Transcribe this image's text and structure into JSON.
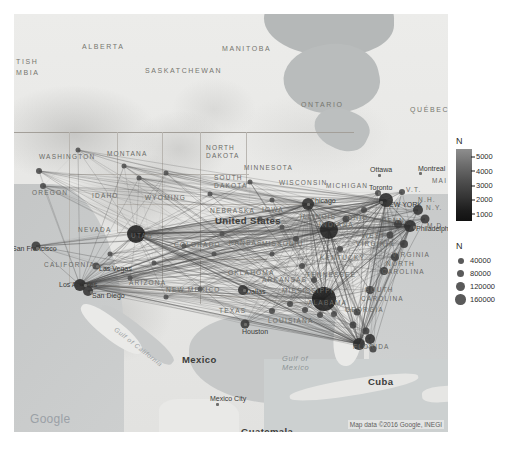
{
  "map": {
    "provider": "Google Maps",
    "google_logo": "Google",
    "attribution": "Map data ©2016 Google, INEGI",
    "countries": [
      {
        "name": "United States",
        "x": 201,
        "y": 201
      },
      {
        "name": "Mexico",
        "x": 168,
        "y": 340
      },
      {
        "name": "Cuba",
        "x": 354,
        "y": 362
      },
      {
        "name": "Guatemala",
        "x": 227,
        "y": 412
      },
      {
        "name": "Honduras",
        "x": 262,
        "y": 419
      },
      {
        "name": "Dominic",
        "x": 441,
        "y": 375
      },
      {
        "name": "Republ",
        "x": 442,
        "y": 383
      }
    ],
    "provinces": [
      {
        "name": "TISH",
        "x": 2,
        "y": 44
      },
      {
        "name": "MBIA",
        "x": 2,
        "y": 55
      },
      {
        "name": "ALBERTA",
        "x": 68,
        "y": 29
      },
      {
        "name": "SASKATCHEWAN",
        "x": 131,
        "y": 53
      },
      {
        "name": "MANITOBA",
        "x": 208,
        "y": 31
      },
      {
        "name": "ONTARIO",
        "x": 287,
        "y": 87
      },
      {
        "name": "QUÉBEC",
        "x": 396,
        "y": 92
      }
    ],
    "states": [
      {
        "name": "WASHINGTON",
        "x": 25,
        "y": 139
      },
      {
        "name": "MONTANA",
        "x": 93,
        "y": 136
      },
      {
        "name": "NORTH",
        "x": 192,
        "y": 130
      },
      {
        "name": "DAKOTA",
        "x": 192,
        "y": 138
      },
      {
        "name": "MINNESOTA",
        "x": 230,
        "y": 150
      },
      {
        "name": "OREGON",
        "x": 18,
        "y": 175
      },
      {
        "name": "IDAHO",
        "x": 78,
        "y": 178
      },
      {
        "name": "WYOMING",
        "x": 131,
        "y": 180
      },
      {
        "name": "SOUTH",
        "x": 200,
        "y": 160
      },
      {
        "name": "DAKOTA",
        "x": 200,
        "y": 168
      },
      {
        "name": "WISCONSIN",
        "x": 265,
        "y": 165
      },
      {
        "name": "MICHIGAN",
        "x": 312,
        "y": 168
      },
      {
        "name": "NEBRASKA",
        "x": 196,
        "y": 193
      },
      {
        "name": "IOWA",
        "x": 248,
        "y": 192
      },
      {
        "name": "ILLINOIS",
        "x": 286,
        "y": 199
      },
      {
        "name": "NEVADA",
        "x": 64,
        "y": 212
      },
      {
        "name": "UTAH",
        "x": 117,
        "y": 218
      },
      {
        "name": "COLORADO",
        "x": 160,
        "y": 227
      },
      {
        "name": "KANSAS",
        "x": 215,
        "y": 225
      },
      {
        "name": "MISSOURI",
        "x": 248,
        "y": 226
      },
      {
        "name": "INDIANA",
        "x": 305,
        "y": 207
      },
      {
        "name": "OHIO",
        "x": 333,
        "y": 200
      },
      {
        "name": "PENN.",
        "x": 368,
        "y": 203
      },
      {
        "name": "CALIFORNIA",
        "x": 30,
        "y": 247
      },
      {
        "name": "WEST",
        "x": 348,
        "y": 218
      },
      {
        "name": "VIRGINIA",
        "x": 342,
        "y": 226
      },
      {
        "name": "VIRGINIA",
        "x": 378,
        "y": 237
      },
      {
        "name": "KENTUCKY",
        "x": 306,
        "y": 240
      },
      {
        "name": "ARIZONA",
        "x": 115,
        "y": 265
      },
      {
        "name": "NEW MEXICO",
        "x": 152,
        "y": 272
      },
      {
        "name": "OKLAHOMA",
        "x": 214,
        "y": 255
      },
      {
        "name": "ARKANSAS",
        "x": 248,
        "y": 262
      },
      {
        "name": "TENNESSEE",
        "x": 292,
        "y": 257
      },
      {
        "name": "NORTH",
        "x": 372,
        "y": 246
      },
      {
        "name": "CAROLINA",
        "x": 368,
        "y": 254
      },
      {
        "name": "MISSISSIPPI",
        "x": 268,
        "y": 273
      },
      {
        "name": "SOUTH",
        "x": 351,
        "y": 272
      },
      {
        "name": "CAROLINA",
        "x": 347,
        "y": 281
      },
      {
        "name": "ALABAMA",
        "x": 294,
        "y": 285
      },
      {
        "name": "GEORGIA",
        "x": 331,
        "y": 292
      },
      {
        "name": "TEXAS",
        "x": 205,
        "y": 293
      },
      {
        "name": "LOUISIANA",
        "x": 254,
        "y": 303
      },
      {
        "name": "FLORIDA",
        "x": 339,
        "y": 329
      },
      {
        "name": "V.T.",
        "x": 392,
        "y": 172
      },
      {
        "name": "N.H.",
        "x": 404,
        "y": 182
      },
      {
        "name": "MAI",
        "x": 418,
        "y": 163
      },
      {
        "name": "N.Y.",
        "x": 412,
        "y": 190
      },
      {
        "name": "M.D.",
        "x": 413,
        "y": 208
      }
    ],
    "cities": [
      {
        "name": "Chicago",
        "x": 296,
        "y": 183,
        "dx": 293,
        "dy": 189
      },
      {
        "name": "Ottawa",
        "x": 356,
        "y": 152,
        "dx": 364,
        "dy": 160
      },
      {
        "name": "Montreal",
        "x": 404,
        "y": 151,
        "dx": 405,
        "dy": 158
      },
      {
        "name": "Toronto",
        "x": 355,
        "y": 170,
        "dx": 364,
        "dy": 178
      },
      {
        "name": "NEW YORK",
        "x": 370,
        "y": 187,
        "dx": 366,
        "dy": 187
      },
      {
        "name": "Philadelphia",
        "x": 402,
        "y": 211,
        "dx": 399,
        "dy": 212
      },
      {
        "name": "San Francisco",
        "x": -2,
        "y": 231,
        "dx": 22,
        "dy": 233
      },
      {
        "name": "Las Vegas",
        "x": 85,
        "y": 251,
        "dx": 82,
        "dy": 251
      },
      {
        "name": "Los Angeles",
        "x": 45,
        "y": 267,
        "dx": 70,
        "dy": 270
      },
      {
        "name": "San Diego",
        "x": 78,
        "y": 278,
        "dx": 76,
        "dy": 277
      },
      {
        "name": "Dallas",
        "x": 232,
        "y": 274,
        "dx": 229,
        "dy": 275
      },
      {
        "name": "Houston",
        "x": 228,
        "y": 314,
        "dx": 230,
        "dy": 309
      },
      {
        "name": "Mexico City",
        "x": 196,
        "y": 381,
        "dx": 202,
        "dy": 389
      }
    ],
    "seas": [
      {
        "name": "Gulf of",
        "x": 268,
        "y": 340
      },
      {
        "name": "Mexico",
        "x": 268,
        "y": 349
      },
      {
        "name": "Gulf of California",
        "x": 104,
        "y": 311
      }
    ]
  },
  "legends": {
    "color_legend": {
      "title": "N",
      "ticks": [
        5000,
        4000,
        3000,
        2000,
        1000
      ],
      "high_color": "#8e8e8e",
      "low_color": "#111111"
    },
    "size_legend": {
      "title": "N",
      "items": [
        {
          "label": "40000",
          "size": 6
        },
        {
          "label": "80000",
          "size": 7.5
        },
        {
          "label": "120000",
          "size": 9
        },
        {
          "label": "160000",
          "size": 10.5
        }
      ],
      "dot_color": "#5a5a5a"
    }
  },
  "network": {
    "edge_color": "#4a4a4a",
    "node_color": "#3c3c3c",
    "nodes": [
      {
        "x": 310,
        "y": 285,
        "r": 12,
        "c": "#1c1c1c"
      },
      {
        "x": 315,
        "y": 216,
        "r": 9,
        "c": "#252525"
      },
      {
        "x": 122,
        "y": 220,
        "r": 9,
        "c": "#202020"
      },
      {
        "x": 372,
        "y": 186,
        "r": 7,
        "c": "#2a2a2a"
      },
      {
        "x": 396,
        "y": 212,
        "r": 6,
        "c": "#2e2e2e"
      },
      {
        "x": 294,
        "y": 190,
        "r": 6,
        "c": "#303030"
      },
      {
        "x": 345,
        "y": 330,
        "r": 6,
        "c": "#2c2c2c"
      },
      {
        "x": 356,
        "y": 325,
        "r": 5,
        "c": "#303030"
      },
      {
        "x": 66,
        "y": 271,
        "r": 6,
        "c": "#2a2a2a"
      },
      {
        "x": 74,
        "y": 277,
        "r": 5,
        "c": "#333"
      },
      {
        "x": 22,
        "y": 232,
        "r": 4.5,
        "c": "#3a3a3a"
      },
      {
        "x": 229,
        "y": 276,
        "r": 5,
        "c": "#333"
      },
      {
        "x": 231,
        "y": 310,
        "r": 4.5,
        "c": "#383838"
      },
      {
        "x": 404,
        "y": 196,
        "r": 5,
        "c": "#333"
      },
      {
        "x": 411,
        "y": 205,
        "r": 4.5,
        "c": "#383838"
      },
      {
        "x": 390,
        "y": 230,
        "r": 4,
        "c": "#3c3c3c"
      },
      {
        "x": 381,
        "y": 243,
        "r": 4,
        "c": "#3c3c3c"
      },
      {
        "x": 370,
        "y": 257,
        "r": 4,
        "c": "#3c3c3c"
      },
      {
        "x": 356,
        "y": 276,
        "r": 4,
        "c": "#3c3c3c"
      },
      {
        "x": 343,
        "y": 298,
        "r": 3.5,
        "c": "#404040"
      },
      {
        "x": 339,
        "y": 311,
        "r": 3.5,
        "c": "#404040"
      },
      {
        "x": 352,
        "y": 317,
        "r": 3.5,
        "c": "#404040"
      },
      {
        "x": 359,
        "y": 335,
        "r": 3.5,
        "c": "#404040"
      },
      {
        "x": 82,
        "y": 252,
        "r": 3.5,
        "c": "#444"
      },
      {
        "x": 25,
        "y": 157,
        "r": 3,
        "c": "#4a4a4a"
      },
      {
        "x": 29,
        "y": 172,
        "r": 3,
        "c": "#4a4a4a"
      },
      {
        "x": 64,
        "y": 136,
        "r": 2.5,
        "c": "#505050"
      },
      {
        "x": 110,
        "y": 152,
        "r": 2.5,
        "c": "#505050"
      },
      {
        "x": 125,
        "y": 164,
        "r": 2.5,
        "c": "#505050"
      },
      {
        "x": 152,
        "y": 159,
        "r": 2.5,
        "c": "#505050"
      },
      {
        "x": 196,
        "y": 180,
        "r": 2.5,
        "c": "#505050"
      },
      {
        "x": 236,
        "y": 168,
        "r": 2.5,
        "c": "#505050"
      },
      {
        "x": 246,
        "y": 205,
        "r": 2.5,
        "c": "#505050"
      },
      {
        "x": 258,
        "y": 186,
        "r": 2.5,
        "c": "#505050"
      },
      {
        "x": 268,
        "y": 213,
        "r": 2.5,
        "c": "#505050"
      },
      {
        "x": 208,
        "y": 220,
        "r": 2.5,
        "c": "#505050"
      },
      {
        "x": 170,
        "y": 232,
        "r": 2.5,
        "c": "#505050"
      },
      {
        "x": 140,
        "y": 249,
        "r": 2.5,
        "c": "#505050"
      },
      {
        "x": 152,
        "y": 283,
        "r": 2.5,
        "c": "#505050"
      },
      {
        "x": 186,
        "y": 275,
        "r": 2.5,
        "c": "#505050"
      },
      {
        "x": 200,
        "y": 240,
        "r": 2.5,
        "c": "#505050"
      },
      {
        "x": 258,
        "y": 240,
        "r": 2.5,
        "c": "#4c4c4c"
      },
      {
        "x": 288,
        "y": 252,
        "r": 3,
        "c": "#484848"
      },
      {
        "x": 276,
        "y": 290,
        "r": 3,
        "c": "#484848"
      },
      {
        "x": 258,
        "y": 297,
        "r": 3,
        "c": "#484848"
      },
      {
        "x": 291,
        "y": 296,
        "r": 3,
        "c": "#484848"
      },
      {
        "x": 306,
        "y": 301,
        "r": 3,
        "c": "#484848"
      },
      {
        "x": 320,
        "y": 300,
        "r": 3,
        "c": "#484848"
      },
      {
        "x": 332,
        "y": 205,
        "r": 3.5,
        "c": "#444"
      },
      {
        "x": 350,
        "y": 196,
        "r": 3,
        "c": "#484848"
      },
      {
        "x": 282,
        "y": 225,
        "r": 3,
        "c": "#484848"
      },
      {
        "x": 326,
        "y": 235,
        "r": 3,
        "c": "#484848"
      },
      {
        "x": 300,
        "y": 266,
        "r": 3,
        "c": "#484848"
      },
      {
        "x": 116,
        "y": 264,
        "r": 2.5,
        "c": "#505050"
      },
      {
        "x": 96,
        "y": 240,
        "r": 2.5,
        "c": "#505050"
      },
      {
        "x": 364,
        "y": 179,
        "r": 3,
        "c": "#484848"
      },
      {
        "x": 388,
        "y": 178,
        "r": 3,
        "c": "#484848"
      },
      {
        "x": 384,
        "y": 210,
        "r": 4,
        "c": "#3c3c3c"
      },
      {
        "x": 376,
        "y": 221,
        "r": 3.5,
        "c": "#444"
      }
    ],
    "hubs": [
      {
        "x": 310,
        "y": 285
      },
      {
        "x": 315,
        "y": 216
      },
      {
        "x": 122,
        "y": 220
      },
      {
        "x": 372,
        "y": 186
      },
      {
        "x": 396,
        "y": 212
      },
      {
        "x": 345,
        "y": 330
      },
      {
        "x": 294,
        "y": 190
      },
      {
        "x": 66,
        "y": 271
      }
    ]
  }
}
